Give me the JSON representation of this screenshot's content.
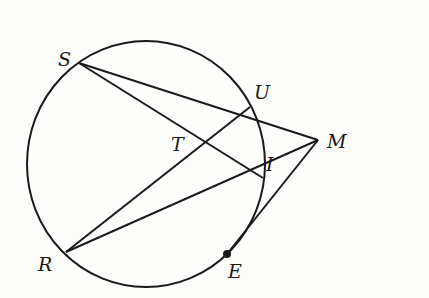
{
  "diagram": {
    "type": "circle-secants-tangent",
    "stroke_color": "#1a1a1a",
    "circle": {
      "cx": 146,
      "cy": 164,
      "rx": 119,
      "ry": 123
    },
    "points": {
      "S": {
        "x": 79,
        "y": 63,
        "label": "S",
        "lx": 58,
        "ly": 66
      },
      "U": {
        "x": 250,
        "y": 107,
        "label": "U",
        "lx": 254,
        "ly": 99
      },
      "T": {
        "x": 208,
        "y": 143,
        "label": "T",
        "lx": 171,
        "ly": 151
      },
      "I": {
        "x": 263,
        "y": 178,
        "label": "I",
        "lx": 266,
        "ly": 171
      },
      "M": {
        "x": 318,
        "y": 140,
        "label": "M",
        "lx": 327,
        "ly": 148
      },
      "R": {
        "x": 66,
        "y": 252,
        "label": "R",
        "lx": 38,
        "ly": 271
      },
      "E": {
        "x": 227,
        "y": 254,
        "label": "E",
        "lx": 228,
        "ly": 278
      }
    },
    "segments": [
      [
        "S",
        "M"
      ],
      [
        "S",
        "I"
      ],
      [
        "R",
        "U"
      ],
      [
        "R",
        "M"
      ],
      [
        "E",
        "M"
      ]
    ],
    "marked_points": [
      "E"
    ]
  }
}
